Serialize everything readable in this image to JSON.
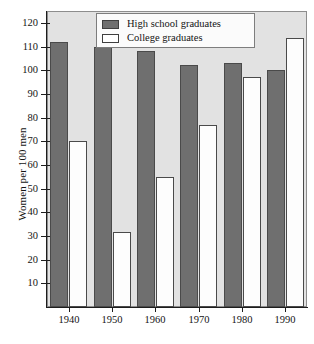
{
  "chart_data": {
    "type": "bar",
    "title": "",
    "xlabel": "",
    "ylabel": "Women per 100 men",
    "categories": [
      "1940",
      "1950",
      "1960",
      "1970",
      "1980",
      "1990"
    ],
    "series": [
      {
        "name": "High school graduates",
        "color": "#6f6f6f",
        "values": [
          112,
          110,
          108,
          102,
          103,
          100
        ]
      },
      {
        "name": "College graduates",
        "color": "#ffffff",
        "values": [
          70,
          31.5,
          55,
          77,
          97,
          113.5
        ]
      }
    ],
    "ylim": [
      0,
      125
    ],
    "yticks": [
      10,
      20,
      30,
      40,
      50,
      60,
      70,
      80,
      90,
      100,
      110,
      120
    ],
    "ytick_labels": [
      "10",
      "20",
      "30",
      "40",
      "50",
      "60",
      "70",
      "80",
      "90",
      "100",
      "110",
      "120"
    ],
    "grid": false,
    "legend_position": "top-center",
    "plot_background": "#e2e2e2",
    "page_background": "#ffffff"
  },
  "legend": {
    "items": [
      {
        "label": "High school graduates",
        "swatch": "dark-gray-filled"
      },
      {
        "label": "College graduates",
        "swatch": "white-outlined"
      }
    ]
  },
  "axes": {
    "y_title": "Women per 100 men"
  }
}
